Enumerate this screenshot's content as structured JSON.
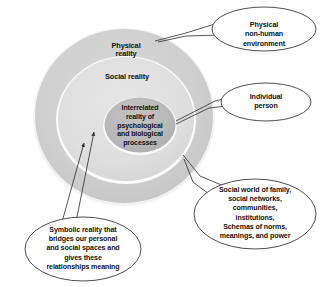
{
  "figure": {
    "type": "concentric-ellipse-diagram",
    "background_color": "#ffffff",
    "text_color": "#111111",
    "outline_color": "#3a3a3a"
  },
  "rings": [
    {
      "id": "physical-reality",
      "label": "Physical\nreality",
      "fill_color": "#cfcfcf",
      "order": 1
    },
    {
      "id": "social-reality",
      "label": "Social reality",
      "fill_color": "#dedede",
      "order": 2
    },
    {
      "id": "interrelated-reality",
      "label": "Interrelated\nreality of\npsychological\nand biological\nprocesses",
      "fill_color": "#b9b9b9",
      "order": 3
    }
  ],
  "callouts": [
    {
      "id": "physical-non-human-environment",
      "label": "Physical\nnon-human\nenvironment",
      "points_to": "physical-reality"
    },
    {
      "id": "individual-person",
      "label": "Individual\nperson",
      "points_to": "interrelated-reality"
    },
    {
      "id": "social-world",
      "label": "Social world of family,\nsocial networks,\ncommunities,\ninstitutions,\nSchemas of norms,\nmeanings, and power",
      "points_to": "social-reality"
    },
    {
      "id": "symbolic-reality",
      "label": "Symbolic reality that\nbridges our personal\nand social spaces and\ngives these\nrelationships meaning",
      "points_to": "boundary-between-social-and-interrelated"
    }
  ]
}
